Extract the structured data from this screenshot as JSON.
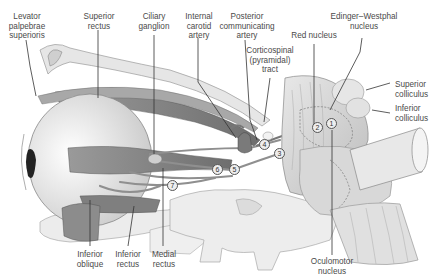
{
  "diagram": {
    "labels": {
      "levator": "Levator\npalpebrae\nsuperioris",
      "superior_rectus": "Superior\nrectus",
      "ciliary_ganglion": "Ciliary\nganglion",
      "internal_carotid": "Internal\ncarotid\nartery",
      "posterior_communicating": "Posterior\ncommunicating\nartery",
      "corticospinal": "Corticospinal\n(pyramidal)\ntract",
      "red_nucleus": "Red nucleus",
      "edinger_westphal": "Edinger–Westphal\nnucleus",
      "superior_colliculus": "Superior\ncolliculus",
      "inferior_colliculus": "Inferior\ncolliculus",
      "inferior_oblique": "Inferior\noblique",
      "inferior_rectus": "Inferior\nrectus",
      "medial_rectus": "Medial\nrectus",
      "oculomotor_nucleus": "Oculomotor\nnucleus"
    },
    "markers": [
      "1",
      "2",
      "3",
      "4",
      "5",
      "6",
      "7"
    ],
    "colors": {
      "muscle": "#8a8a8a",
      "bone": "#e4e4e4",
      "brainstem": "#d6d6d6",
      "eye": "#f0f0f0",
      "leader": "#333333"
    }
  }
}
